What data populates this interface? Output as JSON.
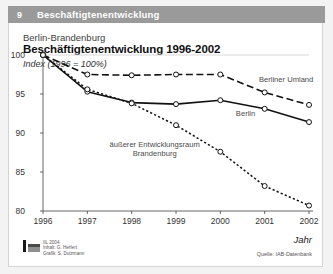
{
  "header": {
    "number": "9",
    "title": "Beschäftigtenentwicklung",
    "bar_color": "#9a9a9a"
  },
  "titles": {
    "subtitle": "Berlin-Brandenburg",
    "main": "Beschäftigtenentwicklung 1996-2002",
    "index_note": "Index (1996 = 100%)"
  },
  "footer": {
    "credit_line1": "IIL 2004",
    "credit_line2": "Inhalt: G. Herfert",
    "credit_line3": "Grafik: S. Dutzmann",
    "source": "Quelle: IAB-Datenbank",
    "logo": "iil-logo"
  },
  "chart_data": {
    "type": "line",
    "title": "Beschäftigtenentwicklung 1996-2002",
    "subtitle": "Berlin-Brandenburg",
    "xlabel": "Jahr",
    "ylabel": "Index (1996 = 100%)",
    "categories": [
      "1996",
      "1997",
      "1998",
      "1999",
      "2000",
      "2001",
      "2002"
    ],
    "x": [
      1996,
      1997,
      1998,
      1999,
      2000,
      2001,
      2002
    ],
    "ylim": [
      80,
      100
    ],
    "xlim": [
      1996,
      2002
    ],
    "yticks": [
      100,
      95,
      90,
      85,
      80
    ],
    "ytick_labels": [
      "100",
      "95",
      "90",
      "85",
      "80"
    ],
    "grid": false,
    "legend": "inline-annotations",
    "series": [
      {
        "name": "Berliner Umland",
        "style": "long-dashed",
        "color": "#111111",
        "label_x": 2001.05,
        "label_y": 96.9,
        "values": [
          100.0,
          97.5,
          97.4,
          97.5,
          97.5,
          95.2,
          93.6
        ]
      },
      {
        "name": "Berlin",
        "style": "solid",
        "color": "#111111",
        "label_x": 2000.35,
        "label_y": 92.6,
        "values": [
          100.0,
          95.3,
          93.9,
          93.7,
          94.2,
          93.1,
          91.4
        ]
      },
      {
        "name": "äußerer Entwicklungsraum Brandenburg",
        "style": "dotted",
        "color": "#111111",
        "label_x": 1998.9,
        "label_y": 88.3,
        "values": [
          100.0,
          95.6,
          93.8,
          91.0,
          87.6,
          83.2,
          80.7
        ]
      }
    ],
    "annotations": [
      {
        "text": "Berliner Umland"
      },
      {
        "text": "Berlin"
      },
      {
        "text": "äußerer Entwicklungsraum"
      },
      {
        "text": "Brandenburg"
      }
    ]
  }
}
